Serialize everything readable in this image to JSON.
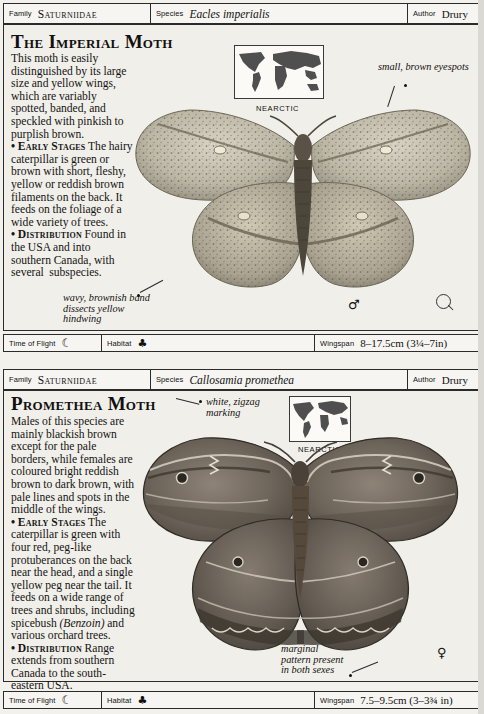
{
  "page": {
    "domain_label": "field-guide-page",
    "background_color": "#eceae5"
  },
  "entries": [
    {
      "id": "imperial-moth",
      "header": {
        "family_caption": "Family",
        "family_value": "Saturniidae",
        "species_caption": "Species",
        "species_value": "Eacles imperialis",
        "author_caption": "Author",
        "author_value": "Drury"
      },
      "title": "The Imperial Moth",
      "description_html": "This moth is easily distinguished by its large size and yellow wings, which are variably spotted, banded, and speckled with pinkish to purplish brown.<br><span class='bullet'>•</span> <b>Early Stages</b> The hairy caterpillar is green or brown with short, fleshy, yellow or reddish brown filaments on the back. It feeds on the foliage of a wide variety of trees.<br><span class='bullet'>•</span> <b>Distribution</b> Found in the USA and into southern Canada, with several&nbsp; subspecies.",
      "map_label": "NEARCTIC",
      "annotations": [
        {
          "name": "eyespots",
          "text": "small, brown eyespots"
        },
        {
          "name": "wavy-band",
          "text": "wavy, brownish band dissects yellow hindwing"
        }
      ],
      "sex_symbol": "♂",
      "footer": {
        "time_caption": "Time of Flight",
        "time_icon": "☾",
        "habitat_caption": "Habitat",
        "habitat_icons": "♣",
        "wingspan_caption": "Wingspan",
        "wingspan_value": "8–17.5cm (3¼–7in)"
      }
    },
    {
      "id": "promethea-moth",
      "header": {
        "family_caption": "Family",
        "family_value": "Saturniidae",
        "species_caption": "Species",
        "species_value": "Callosamia promethea",
        "author_caption": "Author",
        "author_value": "Drury"
      },
      "title": "Promethea Moth",
      "description_html": "Males of this species are mainly blackish brown except for the pale borders, while females are coloured bright reddish brown to dark brown, with pale lines and spots in the middle of the wings.<br><span class='bullet'>•</span> <b>Early Stages</b> The caterpillar is green with four red, peg-like protuberances on the back near the head, and a single yellow peg near the tail. It feeds on a wide range of trees and shrubs, including spicebush <i>(Benzoin)</i> and various orchard trees.<br><span class='bullet'>•</span> <b>Distribution</b> Range extends from southern Canada to the south-eastern USA.",
      "map_label": "NEARCTIC",
      "annotations": [
        {
          "name": "zigzag",
          "text": "white, zigzag marking"
        },
        {
          "name": "marginal-pattern",
          "text": "marginal pattern present in both sexes"
        }
      ],
      "sex_symbol": "♀",
      "footer": {
        "time_caption": "Time of Flight",
        "time_icon": "☾",
        "habitat_caption": "Habitat",
        "habitat_icons": "♣",
        "wingspan_caption": "Wingspan",
        "wingspan_value": "7.5–9.5cm (3–3¾ in)"
      }
    }
  ]
}
